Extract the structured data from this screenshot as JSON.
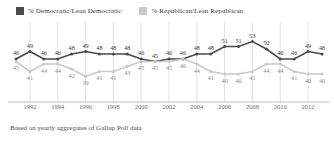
{
  "legend": {
    "items": [
      {
        "name": "democratic",
        "label": "% Democratic/Lean Democratic",
        "color": "#4a4a4a"
      },
      {
        "name": "republican",
        "label": "% Republican/Lean Republican",
        "color": "#c9c9c9"
      }
    ]
  },
  "footnote": "Based on yearly aggregates of Gallup Poll data",
  "axis": {
    "year_ticks": [
      "1992",
      "1994",
      "1996",
      "1998",
      "2000",
      "2002",
      "2004",
      "2006",
      "2008",
      "2010",
      "2012"
    ]
  },
  "chart_data": {
    "type": "line",
    "title": "",
    "subtitle": "",
    "xlabel": "",
    "ylabel": "",
    "grid": "vertical",
    "legend_position": "top-left",
    "ylim": [
      36,
      56
    ],
    "x": [
      1991,
      1992,
      1993,
      1994,
      1995,
      1996,
      1997,
      1998,
      1999,
      2000,
      2001,
      2002,
      2003,
      2004,
      2005,
      2006,
      2007,
      2008,
      2009,
      2010,
      2011,
      2012,
      2013
    ],
    "series": [
      {
        "name": "% Democratic/Lean Democratic",
        "color": "#4a4a4a",
        "values": [
          46,
          49,
          46,
          46,
          48,
          49,
          48,
          48,
          48,
          46,
          45,
          46,
          46,
          48,
          48,
          51,
          51,
          53,
          50,
          46,
          46,
          49,
          48
        ]
      },
      {
        "name": "% Republican/Lean Republican",
        "color": "#c9c9c9",
        "values": [
          45,
          41,
          44,
          44,
          42,
          39,
          41,
          41,
          43,
          45,
          45,
          45,
          46,
          44,
          41,
          40,
          40,
          41,
          44,
          44,
          41,
          40,
          40
        ]
      }
    ]
  }
}
